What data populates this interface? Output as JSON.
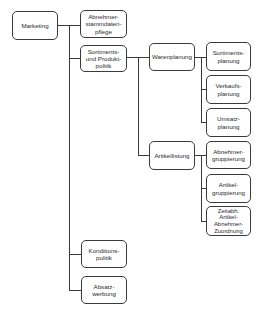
{
  "diagram": {
    "type": "org-chart / hierarchy tree",
    "root": {
      "label": "Marketing",
      "children": [
        {
          "label": "Abnehmer-\nstammdaten-\npflege"
        },
        {
          "label": "Sortiments-\nund Produkt-\npolitik",
          "children": [
            {
              "label": "Warenplanung",
              "children": [
                {
                  "label": "Sortiments-\nplanung"
                },
                {
                  "label": "Verkaufs-\nplanung"
                },
                {
                  "label": "Umsatz-\nplanung"
                }
              ]
            },
            {
              "label": "Artikellistung",
              "children": [
                {
                  "label": "Abnehmer-\ngruppierung"
                },
                {
                  "label": "Artikel-\ngruppierung"
                },
                {
                  "label": "Zeitabh.\nArtikel-\nAbnehmer-\nZuordnung"
                }
              ]
            }
          ]
        },
        {
          "label": "Konditions-\npolitik"
        },
        {
          "label": "Absatz-\nwerbung"
        }
      ]
    }
  },
  "nodes": {
    "marketing": "Marketing",
    "abnehmerstammdatenpflege": "Abnehmer-\nstammdaten-\npflege",
    "sortiments_produktpolitik": "Sortiments-\nund Produkt-\npolitik",
    "konditionspolitik": "Konditions-\npolitik",
    "absatzwerbung": "Absatz-\nwerbung",
    "warenplanung": "Warenplanung",
    "artikellistung": "Artikellistung",
    "sortimentsplanung": "Sortiments-\nplanung",
    "verkaufsplanung": "Verkaufs-\nplanung",
    "umsatzplanung": "Umsatz-\nplanung",
    "abnehmergruppierung": "Abnehmer-\ngruppierung",
    "artikelgruppierung": "Artikel-\ngruppierung",
    "zeitabh_zuordnung": "Zeitabh.\nArtikel-\nAbnehmer-\nZuordnung"
  },
  "colors": {
    "line": "#3a3a3a",
    "text": "#2a2a2a",
    "background": "#ffffff"
  }
}
